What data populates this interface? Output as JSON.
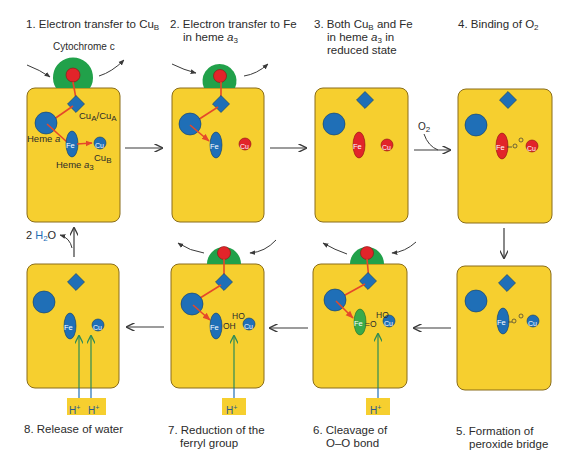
{
  "figure": {
    "colors": {
      "panel_fill": "#f6cf2f",
      "panel_border": "#8a6d1a",
      "oxidized_blue": "#1f6fb7",
      "reduced_red": "#e2242a",
      "ferryl_green": "#3aaa4a",
      "cytochrome_green": "#21a14a",
      "electron_path": "#e5482a",
      "proton_arrow": "#2e8b57",
      "proton_box": "#f6cf2f",
      "water_blue": "#1f6fb7",
      "arrow_gray": "#3a3a3a"
    },
    "steps": [
      {
        "number": "1.",
        "title_main": "Electron transfer to Cu",
        "title_sub": "B",
        "lines": []
      },
      {
        "number": "2.",
        "title_line1": "Electron transfer to Fe",
        "title_line2_pre": "in heme ",
        "title_line2_ital": "a",
        "title_line2_sub": "3"
      },
      {
        "number": "3.",
        "title_line1_pre": "Both Cu",
        "title_line1_sub": "B",
        "title_line1_post": " and Fe",
        "title_line2_pre": "in heme ",
        "title_line2_ital": "a",
        "title_line2_sub": "3",
        "title_line2_post": " in",
        "title_line3": "reduced state"
      },
      {
        "number": "4.",
        "title_pre": "Binding of O",
        "title_sub": "2"
      },
      {
        "number": "5.",
        "title_line1": "Formation of",
        "title_line2": "peroxide bridge"
      },
      {
        "number": "6.",
        "title_line1": "Cleavage of",
        "title_line2": "O–O bond"
      },
      {
        "number": "7.",
        "title_line1": "Reduction of the",
        "title_line2": "ferryl group"
      },
      {
        "number": "8.",
        "title_line1": "Release of water"
      }
    ],
    "annotations": {
      "cytochrome_c": "Cytochrome c",
      "cua_label": "Cu",
      "cua_sub": "A",
      "cua_sep": "/Cu",
      "cua_sub2": "A",
      "heme_a": "Heme ",
      "heme_a_ital": "a",
      "heme_a3": "Heme ",
      "heme_a3_ital": "a",
      "heme_a3_sub": "3",
      "cub_label": "Cu",
      "cub_sub": "B",
      "fe": "Fe",
      "cu": "Cu",
      "o2_pre": "O",
      "o2_sub": "2",
      "o": "O",
      "ho": "HO",
      "oh": "OH",
      "fe_o": "=O",
      "water_count": "2 ",
      "water_h": "H",
      "water_sub": "2",
      "water_o": "O",
      "proton": "H",
      "proton_sup": "+"
    }
  }
}
